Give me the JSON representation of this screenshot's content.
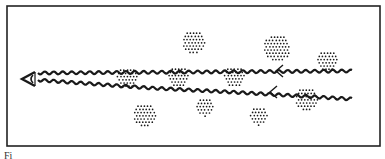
{
  "figure": {
    "caption": "Fi",
    "frame": {
      "x": 7,
      "y": 6,
      "width": 373,
      "height": 140,
      "stroke": "#222222"
    },
    "ink_color": "#1a1a1a",
    "observer": {
      "icon": "eye-arrowhead-icon",
      "x": 28,
      "y": 79
    },
    "rays": [
      {
        "name": "upper-ray",
        "from": [
          38,
          73
        ],
        "to": [
          352,
          71
        ]
      },
      {
        "name": "lower-ray",
        "from": [
          38,
          80
        ],
        "to": [
          352,
          99
        ],
        "bend_x": 230
      }
    ],
    "direction_chevrons": [
      {
        "x": 276,
        "y": 71
      },
      {
        "x": 270,
        "y": 92
      }
    ],
    "particle_clusters": [
      {
        "cx": 127,
        "cy": 78,
        "r": 11,
        "on_ray": true
      },
      {
        "cx": 178,
        "cy": 77,
        "r": 11,
        "on_ray": true
      },
      {
        "cx": 234,
        "cy": 77,
        "r": 11,
        "on_ray": true
      },
      {
        "cx": 194,
        "cy": 42,
        "r": 12,
        "on_ray": false
      },
      {
        "cx": 277,
        "cy": 48,
        "r": 14,
        "on_ray": false
      },
      {
        "cx": 327,
        "cy": 61,
        "r": 11,
        "on_ray": true
      },
      {
        "cx": 307,
        "cy": 99,
        "r": 12,
        "on_ray": true
      },
      {
        "cx": 145,
        "cy": 115,
        "r": 12,
        "on_ray": false
      },
      {
        "cx": 205,
        "cy": 107,
        "r": 10,
        "on_ray": false
      },
      {
        "cx": 259,
        "cy": 116,
        "r": 10,
        "on_ray": false
      }
    ]
  }
}
